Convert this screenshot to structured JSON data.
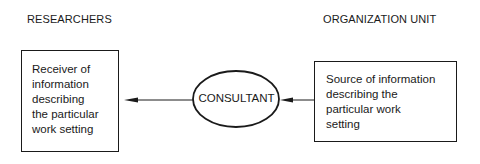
{
  "headings": {
    "left": "RESEARCHERS",
    "right": "ORGANIZATION UNIT"
  },
  "nodes": {
    "researchers_box": {
      "lines": [
        "Receiver of",
        "information",
        "describing",
        "the particular",
        "work setting"
      ]
    },
    "consultant": {
      "label": "CONSULTANT"
    },
    "organization_box": {
      "lines": [
        "Source of information",
        "describing the",
        "particular work",
        "setting"
      ]
    }
  },
  "edges": [
    {
      "from": "organization_box",
      "to": "consultant",
      "type": "arrow"
    },
    {
      "from": "consultant",
      "to": "researchers_box",
      "type": "arrow"
    }
  ],
  "colors": {
    "stroke": "#1a1a1a",
    "background": "#ffffff"
  }
}
